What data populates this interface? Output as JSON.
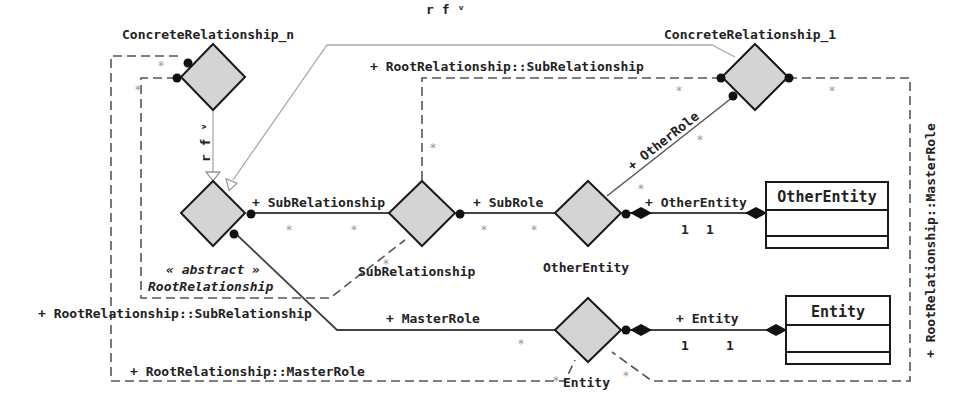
{
  "diagram": {
    "type": "UML association-class / relationship diagram",
    "relationships": [
      {
        "id": "concrete_n",
        "label": "ConcreteRelationship_n"
      },
      {
        "id": "concrete_1",
        "label": "ConcreteRelationship_1"
      },
      {
        "id": "root",
        "stereotype": "« abstract »",
        "label": "RootRelationship"
      },
      {
        "id": "sub",
        "label": "SubRelationship"
      },
      {
        "id": "other",
        "label": "OtherEntity"
      },
      {
        "id": "entity",
        "label": "Entity"
      }
    ],
    "classes": [
      {
        "id": "other_entity_class",
        "name": "OtherEntity"
      },
      {
        "id": "entity_class",
        "name": "Entity"
      }
    ],
    "edge_labels": {
      "rf_top": "r f ᵛ",
      "rf_vertical": "r f ᵛ",
      "root_sub_relationship_top": "+ RootRelationship::SubRelationship",
      "root_sub_relationship_left": "+ RootRelationship::SubRelationship",
      "root_master_role_bottom": "+ RootRelationship::MasterRole",
      "root_master_role_right": "+ RootRelationship::MasterRole",
      "sub_relationship": "+ SubRelationship",
      "sub_role": "+ SubRole",
      "other_role": "+ OtherRole",
      "other_entity_role": "+ OtherEntity",
      "master_role": "+ MasterRole",
      "entity_role": "+ Entity"
    },
    "multiplicities": {
      "many": "*",
      "one": "1"
    },
    "colors": {
      "diamond_fill": "#d4d4d4",
      "stroke": "#1a1a1a",
      "generalization_line": "#aaaaaa",
      "star": "#999999"
    }
  }
}
